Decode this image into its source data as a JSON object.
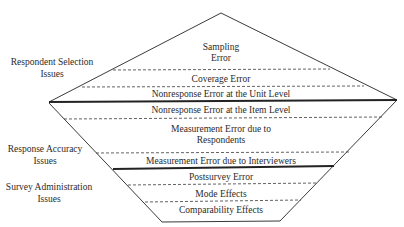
{
  "diagram": {
    "type": "diamond-layered-framework",
    "side_labels": [
      {
        "line1": "Respondent Selection",
        "line2": "Issues"
      },
      {
        "line1": "Response Accuracy",
        "line2": "Issues"
      },
      {
        "line1": "Survey Administration",
        "line2": "Issues"
      }
    ],
    "layers": [
      {
        "line1": "Sampling",
        "line2": "Error"
      },
      {
        "line1": "Coverage Error"
      },
      {
        "line1": "Nonresponse Error at the Unit Level"
      },
      {
        "line1": "Nonresponse Error at the Item Level"
      },
      {
        "line1": "Measurement Error due to",
        "line2": "Respondents"
      },
      {
        "line1": "Measurement Error due to Interviewers"
      },
      {
        "line1": "Postsurvey Error"
      },
      {
        "line1": "Mode Effects"
      },
      {
        "line1": "Comparability Effects"
      }
    ],
    "colors": {
      "line": "#3a3a3a",
      "text": "#2a2a2a",
      "background": "#ffffff"
    }
  }
}
